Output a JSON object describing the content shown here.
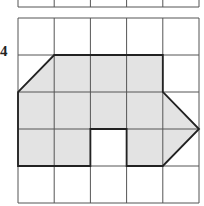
{
  "question_number": "4",
  "grid": {
    "columns": 5,
    "rows": 5,
    "origin_x": 18,
    "origin_y": 18,
    "cell_w": 36.2,
    "cell_h": 37,
    "line_color": "#555555"
  },
  "top_stub": {
    "y_bottom": 7
  },
  "shape": {
    "fill": "#e3e3e3",
    "stroke": "#222222",
    "vertices": [
      [
        1,
        1
      ],
      [
        4,
        1
      ],
      [
        4,
        2
      ],
      [
        5,
        3
      ],
      [
        4,
        4
      ],
      [
        3,
        4
      ],
      [
        3,
        3
      ],
      [
        2,
        3
      ],
      [
        2,
        4
      ],
      [
        0,
        4
      ],
      [
        0,
        2
      ]
    ]
  }
}
